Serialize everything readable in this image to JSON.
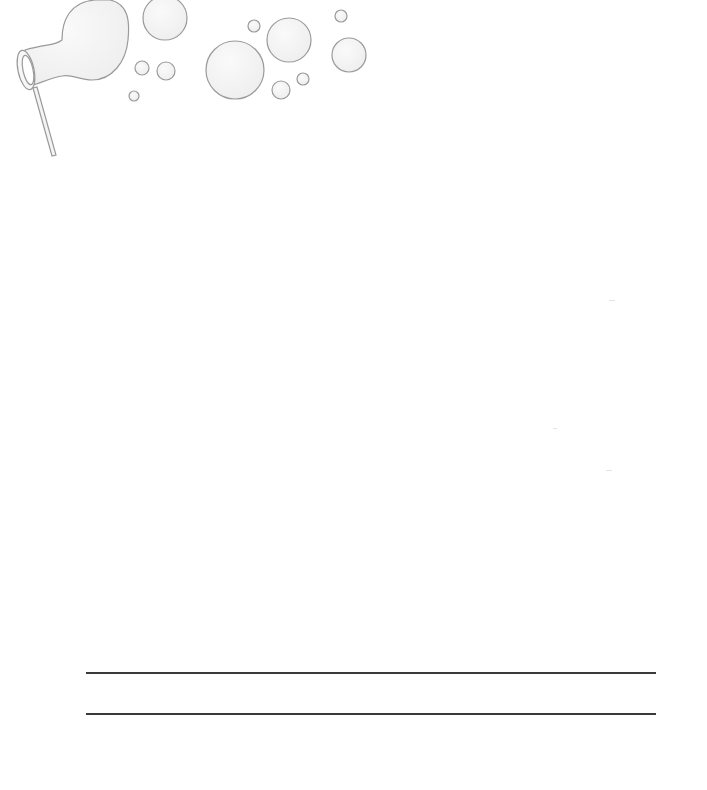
{
  "page": {
    "background": "#ffffff",
    "illustration": {
      "icon": "bubble-wand-icon",
      "bubble_stroke": "#9a9a9a",
      "bubble_fill": "#f2f2f2"
    },
    "ruled_lines": [
      {
        "y": 672,
        "x_start": 86,
        "x_end": 656,
        "color": "#3a3a3a"
      },
      {
        "y": 713,
        "x_start": 86,
        "x_end": 656,
        "color": "#3a3a3a"
      }
    ]
  }
}
